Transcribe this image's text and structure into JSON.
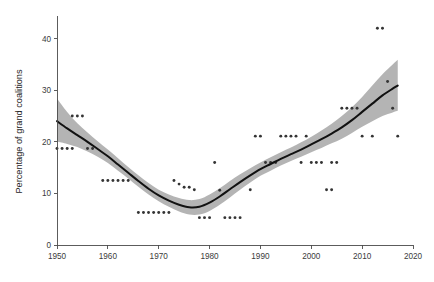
{
  "chart_data": {
    "type": "scatter",
    "title": "",
    "subtitle": "",
    "xlabel": "",
    "ylabel": "Percentage of grand coalitions",
    "xlim": [
      1950,
      2020
    ],
    "ylim": [
      0,
      44
    ],
    "xticks": [
      1950,
      1960,
      1970,
      1980,
      1990,
      2000,
      2010,
      2020
    ],
    "xtick_labels": [
      "1950",
      "1960",
      "1970",
      "1980",
      "1990",
      "2000",
      "2010",
      "2020"
    ],
    "yticks": [
      0,
      10,
      20,
      30,
      40
    ],
    "ytick_labels": [
      "0",
      "10",
      "20",
      "30",
      "40"
    ],
    "grid": false,
    "legend": false,
    "legend_position": "none",
    "colors": {
      "point": "#343434",
      "fit_line": "#111111",
      "confidence_band": "#b4b4b4",
      "axis": "#4a4a4a",
      "background": "#ffffff"
    },
    "series": [
      {
        "name": "Observed percentage of grand coalitions",
        "type": "scatter",
        "points": [
          {
            "x": 1950,
            "y": 18.7
          },
          {
            "x": 1951,
            "y": 18.7
          },
          {
            "x": 1952,
            "y": 18.7
          },
          {
            "x": 1953,
            "y": 18.7
          },
          {
            "x": 1953,
            "y": 25.0
          },
          {
            "x": 1954,
            "y": 25.0
          },
          {
            "x": 1955,
            "y": 25.0
          },
          {
            "x": 1956,
            "y": 18.7
          },
          {
            "x": 1957,
            "y": 18.7
          },
          {
            "x": 1959,
            "y": 12.5
          },
          {
            "x": 1960,
            "y": 12.5
          },
          {
            "x": 1961,
            "y": 12.5
          },
          {
            "x": 1962,
            "y": 12.5
          },
          {
            "x": 1963,
            "y": 12.5
          },
          {
            "x": 1964,
            "y": 12.5
          },
          {
            "x": 1966,
            "y": 6.3
          },
          {
            "x": 1967,
            "y": 6.3
          },
          {
            "x": 1968,
            "y": 6.3
          },
          {
            "x": 1969,
            "y": 6.3
          },
          {
            "x": 1970,
            "y": 6.3
          },
          {
            "x": 1971,
            "y": 6.3
          },
          {
            "x": 1972,
            "y": 6.3
          },
          {
            "x": 1973,
            "y": 12.5
          },
          {
            "x": 1974,
            "y": 11.8
          },
          {
            "x": 1975,
            "y": 11.2
          },
          {
            "x": 1976,
            "y": 11.2
          },
          {
            "x": 1977,
            "y": 10.7
          },
          {
            "x": 1978,
            "y": 5.3
          },
          {
            "x": 1979,
            "y": 5.3
          },
          {
            "x": 1980,
            "y": 5.3
          },
          {
            "x": 1981,
            "y": 16.0
          },
          {
            "x": 1982,
            "y": 10.6
          },
          {
            "x": 1983,
            "y": 5.3
          },
          {
            "x": 1984,
            "y": 5.3
          },
          {
            "x": 1985,
            "y": 5.3
          },
          {
            "x": 1986,
            "y": 5.3
          },
          {
            "x": 1988,
            "y": 10.7
          },
          {
            "x": 1989,
            "y": 21.1
          },
          {
            "x": 1990,
            "y": 21.1
          },
          {
            "x": 1991,
            "y": 16.0
          },
          {
            "x": 1992,
            "y": 16.0
          },
          {
            "x": 1993,
            "y": 16.0
          },
          {
            "x": 1994,
            "y": 21.1
          },
          {
            "x": 1995,
            "y": 21.1
          },
          {
            "x": 1996,
            "y": 21.1
          },
          {
            "x": 1997,
            "y": 21.1
          },
          {
            "x": 1999,
            "y": 21.1
          },
          {
            "x": 1998,
            "y": 16.0
          },
          {
            "x": 2000,
            "y": 16.0
          },
          {
            "x": 2001,
            "y": 16.0
          },
          {
            "x": 2002,
            "y": 16.0
          },
          {
            "x": 2003,
            "y": 10.7
          },
          {
            "x": 2004,
            "y": 10.7
          },
          {
            "x": 2004,
            "y": 16.0
          },
          {
            "x": 2005,
            "y": 16.0
          },
          {
            "x": 2006,
            "y": 26.5
          },
          {
            "x": 2007,
            "y": 26.5
          },
          {
            "x": 2008,
            "y": 26.5
          },
          {
            "x": 2009,
            "y": 26.5
          },
          {
            "x": 2010,
            "y": 21.1
          },
          {
            "x": 2012,
            "y": 21.1
          },
          {
            "x": 2013,
            "y": 42.0
          },
          {
            "x": 2014,
            "y": 42.0
          },
          {
            "x": 2015,
            "y": 31.7
          },
          {
            "x": 2016,
            "y": 26.5
          },
          {
            "x": 2017,
            "y": 21.1
          }
        ]
      },
      {
        "name": "Fitted trend (LOESS)",
        "type": "line",
        "points": [
          {
            "x": 1950,
            "y": 24.0
          },
          {
            "x": 1952,
            "y": 22.6
          },
          {
            "x": 1954,
            "y": 21.3
          },
          {
            "x": 1956,
            "y": 20.0
          },
          {
            "x": 1958,
            "y": 18.6
          },
          {
            "x": 1960,
            "y": 17.2
          },
          {
            "x": 1962,
            "y": 15.6
          },
          {
            "x": 1964,
            "y": 14.0
          },
          {
            "x": 1966,
            "y": 12.4
          },
          {
            "x": 1968,
            "y": 10.9
          },
          {
            "x": 1970,
            "y": 9.6
          },
          {
            "x": 1972,
            "y": 8.6
          },
          {
            "x": 1974,
            "y": 7.8
          },
          {
            "x": 1976,
            "y": 7.3
          },
          {
            "x": 1978,
            "y": 7.4
          },
          {
            "x": 1980,
            "y": 8.2
          },
          {
            "x": 1982,
            "y": 9.4
          },
          {
            "x": 1984,
            "y": 10.8
          },
          {
            "x": 1986,
            "y": 12.2
          },
          {
            "x": 1988,
            "y": 13.5
          },
          {
            "x": 1990,
            "y": 14.7
          },
          {
            "x": 1992,
            "y": 15.7
          },
          {
            "x": 1994,
            "y": 16.7
          },
          {
            "x": 1996,
            "y": 17.6
          },
          {
            "x": 1998,
            "y": 18.5
          },
          {
            "x": 2000,
            "y": 19.5
          },
          {
            "x": 2002,
            "y": 20.5
          },
          {
            "x": 2004,
            "y": 21.6
          },
          {
            "x": 2006,
            "y": 22.8
          },
          {
            "x": 2008,
            "y": 24.2
          },
          {
            "x": 2010,
            "y": 25.8
          },
          {
            "x": 2012,
            "y": 27.4
          },
          {
            "x": 2014,
            "y": 29.0
          },
          {
            "x": 2016,
            "y": 30.3
          },
          {
            "x": 2017,
            "y": 30.9
          }
        ]
      },
      {
        "name": "95% confidence band",
        "type": "band",
        "upper": [
          {
            "x": 1950,
            "y": 28.4
          },
          {
            "x": 1952,
            "y": 25.8
          },
          {
            "x": 1954,
            "y": 23.6
          },
          {
            "x": 1956,
            "y": 21.8
          },
          {
            "x": 1958,
            "y": 20.1
          },
          {
            "x": 1960,
            "y": 18.5
          },
          {
            "x": 1962,
            "y": 16.8
          },
          {
            "x": 1964,
            "y": 15.1
          },
          {
            "x": 1966,
            "y": 13.5
          },
          {
            "x": 1968,
            "y": 12.0
          },
          {
            "x": 1970,
            "y": 10.7
          },
          {
            "x": 1972,
            "y": 9.8
          },
          {
            "x": 1974,
            "y": 9.1
          },
          {
            "x": 1976,
            "y": 8.7
          },
          {
            "x": 1978,
            "y": 8.9
          },
          {
            "x": 1980,
            "y": 9.8
          },
          {
            "x": 1982,
            "y": 11.0
          },
          {
            "x": 1984,
            "y": 12.4
          },
          {
            "x": 1986,
            "y": 13.7
          },
          {
            "x": 1988,
            "y": 14.9
          },
          {
            "x": 1990,
            "y": 16.0
          },
          {
            "x": 1992,
            "y": 17.0
          },
          {
            "x": 1994,
            "y": 18.0
          },
          {
            "x": 1996,
            "y": 18.9
          },
          {
            "x": 1998,
            "y": 19.9
          },
          {
            "x": 2000,
            "y": 21.0
          },
          {
            "x": 2002,
            "y": 22.2
          },
          {
            "x": 2004,
            "y": 23.5
          },
          {
            "x": 2006,
            "y": 25.0
          },
          {
            "x": 2008,
            "y": 26.7
          },
          {
            "x": 2010,
            "y": 28.7
          },
          {
            "x": 2012,
            "y": 30.9
          },
          {
            "x": 2014,
            "y": 33.1
          },
          {
            "x": 2016,
            "y": 35.0
          },
          {
            "x": 2017,
            "y": 35.9
          }
        ],
        "lower": [
          {
            "x": 1950,
            "y": 20.0
          },
          {
            "x": 1952,
            "y": 19.6
          },
          {
            "x": 1954,
            "y": 19.0
          },
          {
            "x": 1956,
            "y": 18.1
          },
          {
            "x": 1958,
            "y": 17.1
          },
          {
            "x": 1960,
            "y": 15.9
          },
          {
            "x": 1962,
            "y": 14.4
          },
          {
            "x": 1964,
            "y": 12.9
          },
          {
            "x": 1966,
            "y": 11.3
          },
          {
            "x": 1968,
            "y": 9.8
          },
          {
            "x": 1970,
            "y": 8.5
          },
          {
            "x": 1972,
            "y": 7.4
          },
          {
            "x": 1974,
            "y": 6.5
          },
          {
            "x": 1976,
            "y": 5.9
          },
          {
            "x": 1978,
            "y": 5.9
          },
          {
            "x": 1980,
            "y": 6.6
          },
          {
            "x": 1982,
            "y": 7.8
          },
          {
            "x": 1984,
            "y": 9.2
          },
          {
            "x": 1986,
            "y": 10.7
          },
          {
            "x": 1988,
            "y": 12.1
          },
          {
            "x": 1990,
            "y": 13.4
          },
          {
            "x": 1992,
            "y": 14.4
          },
          {
            "x": 1994,
            "y": 15.4
          },
          {
            "x": 1996,
            "y": 16.3
          },
          {
            "x": 1998,
            "y": 17.1
          },
          {
            "x": 2000,
            "y": 18.0
          },
          {
            "x": 2002,
            "y": 18.8
          },
          {
            "x": 2004,
            "y": 19.7
          },
          {
            "x": 2006,
            "y": 20.6
          },
          {
            "x": 2008,
            "y": 21.7
          },
          {
            "x": 2010,
            "y": 22.9
          },
          {
            "x": 2012,
            "y": 24.0
          },
          {
            "x": 2014,
            "y": 25.0
          },
          {
            "x": 2016,
            "y": 25.7
          },
          {
            "x": 2017,
            "y": 26.0
          }
        ]
      }
    ]
  },
  "plot_geometry": {
    "left": 57,
    "right": 413,
    "top": 18,
    "bottom": 245,
    "point_radius": 1.45
  }
}
